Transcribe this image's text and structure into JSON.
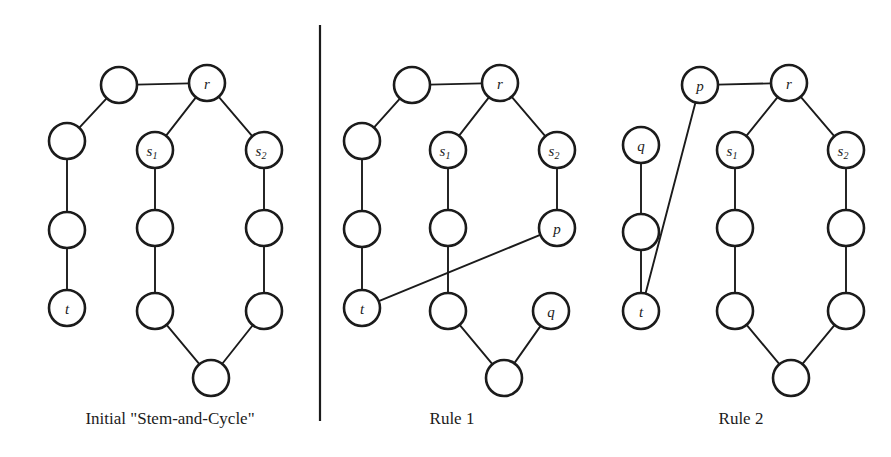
{
  "figure": {
    "background_color": "#ffffff",
    "ink_color": "#1b1b1b",
    "node_radius": 18,
    "node_fill": "#ffffff",
    "width": 891,
    "height": 457
  },
  "divider": {
    "x": 320,
    "y1": 25,
    "y2": 421
  },
  "panels": [
    {
      "id": "panel-initial",
      "caption": "Initial \"Stem-and-Cycle\"",
      "caption_x": 170,
      "caption_y": 424,
      "nodes": [
        {
          "id": "n1",
          "label": "",
          "sub": "",
          "cx": 119,
          "cy": 85
        },
        {
          "id": "n2",
          "label": "",
          "sub": "",
          "cx": 67,
          "cy": 141
        },
        {
          "id": "n3",
          "label": "",
          "sub": "",
          "cx": 67,
          "cy": 230
        },
        {
          "id": "t",
          "label": "t",
          "sub": "",
          "cx": 67,
          "cy": 308
        },
        {
          "id": "r",
          "label": "r",
          "sub": "",
          "cx": 207,
          "cy": 83
        },
        {
          "id": "s1",
          "label": "s",
          "sub": "1",
          "cx": 155,
          "cy": 150
        },
        {
          "id": "s2",
          "label": "s",
          "sub": "2",
          "cx": 264,
          "cy": 150
        },
        {
          "id": "a1",
          "label": "",
          "sub": "",
          "cx": 155,
          "cy": 228
        },
        {
          "id": "a2",
          "label": "",
          "sub": "",
          "cx": 155,
          "cy": 311
        },
        {
          "id": "b1",
          "label": "",
          "sub": "",
          "cx": 264,
          "cy": 228
        },
        {
          "id": "b2",
          "label": "",
          "sub": "",
          "cx": 264,
          "cy": 311
        },
        {
          "id": "c",
          "label": "",
          "sub": "",
          "cx": 211,
          "cy": 378
        }
      ],
      "edges": [
        [
          "n1",
          "r"
        ],
        [
          "n1",
          "n2"
        ],
        [
          "n2",
          "n3"
        ],
        [
          "n3",
          "t"
        ],
        [
          "r",
          "s1"
        ],
        [
          "r",
          "s2"
        ],
        [
          "s1",
          "a1"
        ],
        [
          "a1",
          "a2"
        ],
        [
          "a2",
          "c"
        ],
        [
          "s2",
          "b1"
        ],
        [
          "b1",
          "b2"
        ],
        [
          "b2",
          "c"
        ]
      ]
    },
    {
      "id": "panel-rule1",
      "caption": "Rule 1",
      "caption_x": 452,
      "caption_y": 424,
      "nodes": [
        {
          "id": "n1",
          "label": "",
          "sub": "",
          "cx": 412,
          "cy": 85
        },
        {
          "id": "n2",
          "label": "",
          "sub": "",
          "cx": 362,
          "cy": 141
        },
        {
          "id": "n3",
          "label": "",
          "sub": "",
          "cx": 362,
          "cy": 229
        },
        {
          "id": "t",
          "label": "t",
          "sub": "",
          "cx": 362,
          "cy": 308
        },
        {
          "id": "r",
          "label": "r",
          "sub": "",
          "cx": 500,
          "cy": 83
        },
        {
          "id": "s1",
          "label": "s",
          "sub": "1",
          "cx": 448,
          "cy": 150
        },
        {
          "id": "s2",
          "label": "s",
          "sub": "2",
          "cx": 557,
          "cy": 150
        },
        {
          "id": "a1",
          "label": "",
          "sub": "",
          "cx": 448,
          "cy": 228
        },
        {
          "id": "a2",
          "label": "",
          "sub": "",
          "cx": 448,
          "cy": 311
        },
        {
          "id": "p",
          "label": "p",
          "sub": "",
          "cx": 557,
          "cy": 228
        },
        {
          "id": "q",
          "label": "q",
          "sub": "",
          "cx": 551,
          "cy": 311
        },
        {
          "id": "c",
          "label": "",
          "sub": "",
          "cx": 504,
          "cy": 378
        }
      ],
      "edges": [
        [
          "n1",
          "r"
        ],
        [
          "n1",
          "n2"
        ],
        [
          "n2",
          "n3"
        ],
        [
          "n3",
          "t"
        ],
        [
          "r",
          "s1"
        ],
        [
          "r",
          "s2"
        ],
        [
          "s1",
          "a1"
        ],
        [
          "a1",
          "a2"
        ],
        [
          "a2",
          "c"
        ],
        [
          "s2",
          "p"
        ],
        [
          "p",
          "t"
        ],
        [
          "q",
          "c"
        ]
      ]
    },
    {
      "id": "panel-rule2",
      "caption": "Rule 2",
      "caption_x": 741,
      "caption_y": 424,
      "nodes": [
        {
          "id": "p",
          "label": "p",
          "sub": "",
          "cx": 700,
          "cy": 85
        },
        {
          "id": "q",
          "label": "q",
          "sub": "",
          "cx": 641,
          "cy": 145
        },
        {
          "id": "n3",
          "label": "",
          "sub": "",
          "cx": 641,
          "cy": 232
        },
        {
          "id": "t",
          "label": "t",
          "sub": "",
          "cx": 641,
          "cy": 311
        },
        {
          "id": "r",
          "label": "r",
          "sub": "",
          "cx": 789,
          "cy": 83
        },
        {
          "id": "s1",
          "label": "s",
          "sub": "1",
          "cx": 735,
          "cy": 150
        },
        {
          "id": "s2",
          "label": "s",
          "sub": "2",
          "cx": 846,
          "cy": 150
        },
        {
          "id": "a1",
          "label": "",
          "sub": "",
          "cx": 735,
          "cy": 228
        },
        {
          "id": "a2",
          "label": "",
          "sub": "",
          "cx": 735,
          "cy": 311
        },
        {
          "id": "b1",
          "label": "",
          "sub": "",
          "cx": 846,
          "cy": 228
        },
        {
          "id": "b2",
          "label": "",
          "sub": "",
          "cx": 846,
          "cy": 311
        },
        {
          "id": "c",
          "label": "",
          "sub": "",
          "cx": 791,
          "cy": 378
        }
      ],
      "edges": [
        [
          "p",
          "r"
        ],
        [
          "p",
          "t"
        ],
        [
          "q",
          "n3"
        ],
        [
          "n3",
          "t"
        ],
        [
          "r",
          "s1"
        ],
        [
          "r",
          "s2"
        ],
        [
          "s1",
          "a1"
        ],
        [
          "a1",
          "a2"
        ],
        [
          "a2",
          "c"
        ],
        [
          "s2",
          "b1"
        ],
        [
          "b1",
          "b2"
        ],
        [
          "b2",
          "c"
        ]
      ]
    }
  ]
}
